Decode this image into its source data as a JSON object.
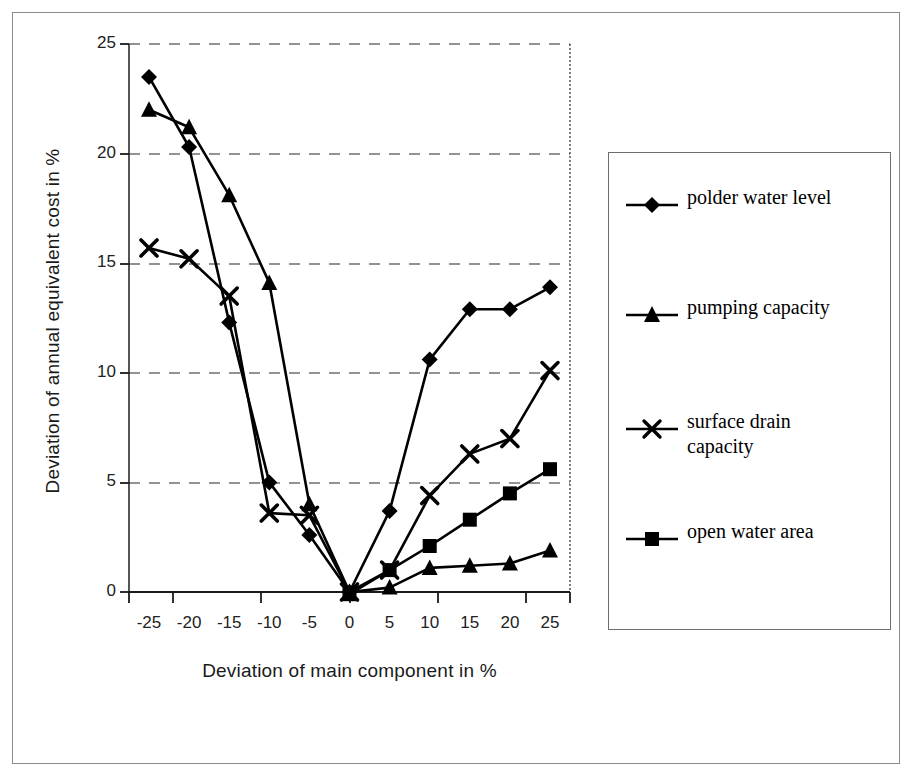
{
  "chart_data": {
    "type": "line",
    "title": "",
    "xlabel": "Deviation of main component in %",
    "ylabel": "Deviation of annual equivalent cost in %",
    "x": [
      -25,
      -20,
      -15,
      -10,
      -5,
      0,
      5,
      10,
      15,
      20,
      25
    ],
    "xticklabels": [
      "-25",
      "-20",
      "-15",
      "-10",
      "-5",
      "0",
      "5",
      "10",
      "15",
      "20",
      "25"
    ],
    "yticklabels": [
      "0",
      "5",
      "10",
      "15",
      "20",
      "25"
    ],
    "yticks": [
      0,
      5,
      10,
      15,
      20,
      25
    ],
    "xlim": [
      -27.5,
      27.5
    ],
    "ylim": [
      0,
      25
    ],
    "grid": "horizontal-dashed",
    "legend_position": "right",
    "series": [
      {
        "name": "polder water level",
        "marker": "diamond",
        "values": [
          23.5,
          20.3,
          12.3,
          5.0,
          2.6,
          0.0,
          3.7,
          10.6,
          12.9,
          12.9,
          13.9
        ]
      },
      {
        "name": "pumping capacity",
        "marker": "triangle",
        "values": [
          22.0,
          21.2,
          18.1,
          14.1,
          4.0,
          0.0,
          0.2,
          1.1,
          1.2,
          1.3,
          1.9
        ]
      },
      {
        "name": "surface drain capacity",
        "marker": "cross",
        "values": [
          15.7,
          15.2,
          13.5,
          3.6,
          3.5,
          0.0,
          1.0,
          4.4,
          6.3,
          7.0,
          10.1
        ]
      },
      {
        "name": "open water area",
        "marker": "square",
        "values": [
          null,
          null,
          null,
          null,
          null,
          -0.1,
          1.0,
          2.1,
          3.3,
          4.5,
          5.6
        ]
      }
    ]
  },
  "legend": {
    "entries": [
      {
        "label": "polder water level",
        "marker": "diamond-marker-icon"
      },
      {
        "label": "pumping capacity",
        "marker": "triangle-marker-icon"
      },
      {
        "label": "surface drain\ncapacity",
        "marker": "cross-marker-icon"
      },
      {
        "label": "open water area",
        "marker": "square-marker-icon"
      }
    ]
  },
  "colors": {
    "series": "#000000",
    "grid": "#777777",
    "axis": "#1a1a1a",
    "frame": "#8d8d8d",
    "background": "#ffffff"
  }
}
